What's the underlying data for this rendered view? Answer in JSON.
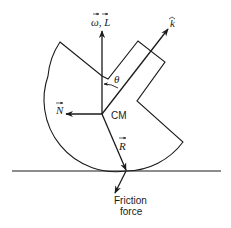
{
  "diagram": {
    "labels": {
      "omega_L": "ω, L",
      "k_hat": "k",
      "theta": "θ",
      "N": "N",
      "CM": "CM",
      "R": "R",
      "friction_line1": "Friction",
      "friction_line2": "force"
    },
    "vectors": [
      {
        "name": "angular-velocity-and-momentum",
        "label": "ω, L",
        "direction": "up"
      },
      {
        "name": "k-hat-axis",
        "label": "k",
        "direction": "up-right"
      },
      {
        "name": "N-vector",
        "label": "N",
        "direction": "left"
      },
      {
        "name": "R-vector",
        "label": "R",
        "direction": "down-right to contact point"
      },
      {
        "name": "friction-force",
        "label": "Friction force",
        "direction": "down-left"
      }
    ],
    "colors": {
      "ink": "#1a1a1a",
      "background": "#ffffff"
    }
  }
}
